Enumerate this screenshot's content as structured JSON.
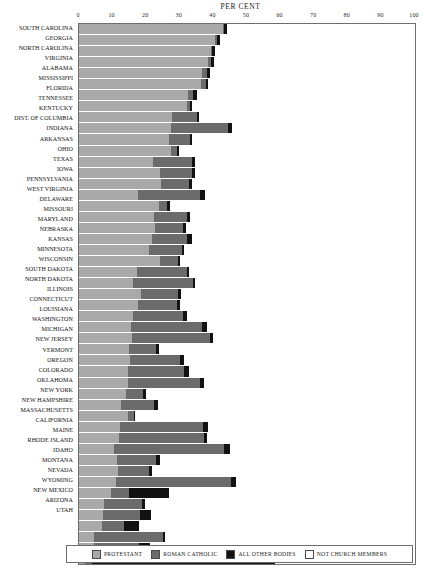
{
  "chart_data": {
    "type": "bar",
    "orientation": "horizontal",
    "stacked": true,
    "title": "PER CENT",
    "xlabel": "PER CENT",
    "ylabel": "",
    "xlim": [
      0,
      100
    ],
    "grid": true,
    "legend_position": "bottom",
    "xticks": [
      0,
      10,
      20,
      30,
      40,
      50,
      60,
      70,
      80,
      90,
      100
    ],
    "xticklabels": [
      "0",
      "10",
      "20",
      "30",
      "40",
      "50",
      "60",
      "70",
      "80",
      "90",
      "100"
    ],
    "series": [
      {
        "name": "PROTESTANT",
        "color": "#a9a9a9"
      },
      {
        "name": "ROMAN CATHOLIC",
        "color": "#6b6b6b"
      },
      {
        "name": "ALL OTHER BODIES",
        "color": "#121212"
      },
      {
        "name": "NOT CHURCH MEMBERS",
        "color": "#ffffff"
      }
    ],
    "categories": [
      "SOUTH CAROLINA",
      "GEORGIA",
      "NORTH CAROLINA",
      "VIRGINIA",
      "ALABAMA",
      "MISSISSIPPI",
      "FLORIDA",
      "TENNESSEE",
      "KENTUCKY",
      "DIST. OF COLUMBIA",
      "INDIANA",
      "ARKANSAS",
      "OHIO",
      "TEXAS",
      "IOWA",
      "PENNSYLVANIA",
      "WEST VIRGINIA",
      "DELAWARE",
      "MISSOURI",
      "MARYLAND",
      "NEBRASKA",
      "KANSAS",
      "MINNESOTA",
      "WISCONSIN",
      "SOUTH DAKOTA",
      "NORTH DAKOTA",
      "ILLINOIS",
      "CONNECTICUT",
      "LOUISIANA",
      "WASHINGTON",
      "MICHIGAN",
      "NEW JERSEY",
      "VERMONT",
      "OREGON",
      "COLORADO",
      "OKLAHOMA",
      "NEW YORK",
      "NEW HAMPSHIRE",
      "MASSACHUSETTS",
      "CALIFORNIA",
      "MAINE",
      "RHODE ISLAND",
      "IDAHO",
      "MONTANA",
      "NEVADA",
      "WYOMING",
      "NEW MEXICO",
      "ARIZONA",
      "UTAH"
    ],
    "rows": [
      {
        "state": "SOUTH CAROLINA",
        "protestant": 42.8,
        "roman_catholic": 0.5,
        "all_other": 0.9,
        "not_church_members": 55.8
      },
      {
        "state": "GEORGIA",
        "protestant": 40.6,
        "roman_catholic": 0.5,
        "all_other": 0.9,
        "not_church_members": 58.0
      },
      {
        "state": "NORTH CAROLINA",
        "protestant": 39.2,
        "roman_catholic": 0.4,
        "all_other": 0.8,
        "not_church_members": 59.6
      },
      {
        "state": "VIRGINIA",
        "protestant": 38.3,
        "roman_catholic": 1.1,
        "all_other": 0.9,
        "not_church_members": 59.7
      },
      {
        "state": "ALABAMA",
        "protestant": 36.5,
        "roman_catholic": 1.6,
        "all_other": 1.0,
        "not_church_members": 60.9
      },
      {
        "state": "MISSISSIPPI",
        "protestant": 36.2,
        "roman_catholic": 1.5,
        "all_other": 0.8,
        "not_church_members": 61.5
      },
      {
        "state": "FLORIDA",
        "protestant": 32.4,
        "roman_catholic": 1.5,
        "all_other": 1.1,
        "not_church_members": 65.0
      },
      {
        "state": "TENNESSEE",
        "protestant": 32.1,
        "roman_catholic": 0.9,
        "all_other": 0.7,
        "not_church_members": 66.3
      },
      {
        "state": "KENTUCKY",
        "protestant": 27.6,
        "roman_catholic": 7.4,
        "all_other": 0.8,
        "not_church_members": 64.2
      },
      {
        "state": "DIST. OF COLUMBIA",
        "protestant": 27.4,
        "roman_catholic": 16.8,
        "all_other": 1.2,
        "not_church_members": 54.6
      },
      {
        "state": "INDIANA",
        "protestant": 26.9,
        "roman_catholic": 6.0,
        "all_other": 0.8,
        "not_church_members": 66.3
      },
      {
        "state": "ARKANSAS",
        "protestant": 27.5,
        "roman_catholic": 1.6,
        "all_other": 0.6,
        "not_church_members": 70.3
      },
      {
        "state": "OHIO",
        "protestant": 22.0,
        "roman_catholic": 11.6,
        "all_other": 1.0,
        "not_church_members": 65.4
      },
      {
        "state": "TEXAS",
        "protestant": 24.2,
        "roman_catholic": 9.4,
        "all_other": 0.8,
        "not_church_members": 65.6
      },
      {
        "state": "IOWA",
        "protestant": 24.5,
        "roman_catholic": 8.3,
        "all_other": 0.7,
        "not_church_members": 66.5
      },
      {
        "state": "PENNSYLVANIA",
        "protestant": 17.7,
        "roman_catholic": 18.3,
        "all_other": 1.6,
        "not_church_members": 62.4
      },
      {
        "state": "WEST VIRGINIA",
        "protestant": 23.7,
        "roman_catholic": 2.6,
        "all_other": 0.8,
        "not_church_members": 72.9
      },
      {
        "state": "DELAWARE",
        "protestant": 22.2,
        "roman_catholic": 9.8,
        "all_other": 0.9,
        "not_church_members": 67.1
      },
      {
        "state": "MISSOURI",
        "protestant": 22.5,
        "roman_catholic": 8.5,
        "all_other": 0.8,
        "not_church_members": 68.2
      },
      {
        "state": "MARYLAND",
        "protestant": 21.8,
        "roman_catholic": 10.4,
        "all_other": 1.3,
        "not_church_members": 66.5
      },
      {
        "state": "NEBRASKA",
        "protestant": 20.9,
        "roman_catholic": 9.7,
        "all_other": 0.7,
        "not_church_members": 68.7
      },
      {
        "state": "KANSAS",
        "protestant": 24.0,
        "roman_catholic": 5.4,
        "all_other": 0.8,
        "not_church_members": 69.8
      },
      {
        "state": "MINNESOTA",
        "protestant": 17.2,
        "roman_catholic": 14.8,
        "all_other": 0.8,
        "not_church_members": 67.2
      },
      {
        "state": "WISCONSIN",
        "protestant": 16.1,
        "roman_catholic": 17.7,
        "all_other": 0.8,
        "not_church_members": 65.4
      },
      {
        "state": "SOUTH DAKOTA",
        "protestant": 18.5,
        "roman_catholic": 11.1,
        "all_other": 0.8,
        "not_church_members": 69.6
      },
      {
        "state": "NORTH DAKOTA",
        "protestant": 17.5,
        "roman_catholic": 11.8,
        "all_other": 0.8,
        "not_church_members": 69.9
      },
      {
        "state": "ILLINOIS",
        "protestant": 16.2,
        "roman_catholic": 14.8,
        "all_other": 1.1,
        "not_church_members": 67.9
      },
      {
        "state": "CONNECTICUT",
        "protestant": 15.5,
        "roman_catholic": 21.2,
        "all_other": 1.5,
        "not_church_members": 61.8
      },
      {
        "state": "LOUISIANA",
        "protestant": 15.7,
        "roman_catholic": 23.4,
        "all_other": 0.7,
        "not_church_members": 60.2
      },
      {
        "state": "WASHINGTON",
        "protestant": 15.0,
        "roman_catholic": 7.9,
        "all_other": 0.8,
        "not_church_members": 76.3
      },
      {
        "state": "MICHIGAN",
        "protestant": 15.3,
        "roman_catholic": 14.8,
        "all_other": 1.1,
        "not_church_members": 68.8
      },
      {
        "state": "NEW JERSEY",
        "protestant": 14.6,
        "roman_catholic": 16.8,
        "all_other": 1.4,
        "not_church_members": 67.2
      },
      {
        "state": "VERMONT",
        "protestant": 14.7,
        "roman_catholic": 21.4,
        "all_other": 1.0,
        "not_church_members": 62.9
      },
      {
        "state": "OREGON",
        "protestant": 14.1,
        "roman_catholic": 4.9,
        "all_other": 0.8,
        "not_church_members": 80.2
      },
      {
        "state": "COLORADO",
        "protestant": 12.6,
        "roman_catholic": 9.8,
        "all_other": 1.0,
        "not_church_members": 76.6
      },
      {
        "state": "OKLAHOMA",
        "protestant": 14.6,
        "roman_catholic": 1.7,
        "all_other": 0.5,
        "not_church_members": 83.2
      },
      {
        "state": "NEW YORK",
        "protestant": 12.3,
        "roman_catholic": 24.5,
        "all_other": 1.5,
        "not_church_members": 61.7
      },
      {
        "state": "NEW HAMPSHIRE",
        "protestant": 11.9,
        "roman_catholic": 25.2,
        "all_other": 1.1,
        "not_church_members": 61.8
      },
      {
        "state": "MASSACHUSETTS",
        "protestant": 10.5,
        "roman_catholic": 32.8,
        "all_other": 1.6,
        "not_church_members": 55.1
      },
      {
        "state": "CALIFORNIA",
        "protestant": 11.3,
        "roman_catholic": 11.5,
        "all_other": 1.3,
        "not_church_members": 75.9
      },
      {
        "state": "MAINE",
        "protestant": 11.5,
        "roman_catholic": 9.4,
        "all_other": 0.8,
        "not_church_members": 78.3
      },
      {
        "state": "RHODE ISLAND",
        "protestant": 11.0,
        "roman_catholic": 34.3,
        "all_other": 1.4,
        "not_church_members": 53.3
      },
      {
        "state": "IDAHO",
        "protestant": 9.6,
        "roman_catholic": 5.4,
        "all_other": 11.8,
        "not_church_members": 73.2
      },
      {
        "state": "MONTANA",
        "protestant": 7.5,
        "roman_catholic": 11.3,
        "all_other": 0.9,
        "not_church_members": 80.3
      },
      {
        "state": "NEVADA",
        "protestant": 7.0,
        "roman_catholic": 11.2,
        "all_other": 3.3,
        "not_church_members": 78.5
      },
      {
        "state": "WYOMING",
        "protestant": 6.8,
        "roman_catholic": 6.5,
        "all_other": 4.5,
        "not_church_members": 82.2
      },
      {
        "state": "NEW MEXICO",
        "protestant": 4.5,
        "roman_catholic": 20.4,
        "all_other": 0.7,
        "not_church_members": 74.4
      },
      {
        "state": "ARIZONA",
        "protestant": 4.6,
        "roman_catholic": 13.4,
        "all_other": 3.1,
        "not_church_members": 78.9
      },
      {
        "state": "UTAH",
        "protestant": 1.8,
        "roman_catholic": 2.1,
        "all_other": 54.3,
        "not_church_members": 41.8
      }
    ]
  },
  "legend": {
    "items": [
      {
        "label": "PROTESTANT",
        "color": "#a9a9a9"
      },
      {
        "label": "ROMAN CATHOLIC",
        "color": "#6b6b6b"
      },
      {
        "label": "ALL OTHER BODIES",
        "color": "#121212"
      },
      {
        "label": "NOT CHURCH MEMBERS",
        "color": "#ffffff"
      }
    ]
  }
}
